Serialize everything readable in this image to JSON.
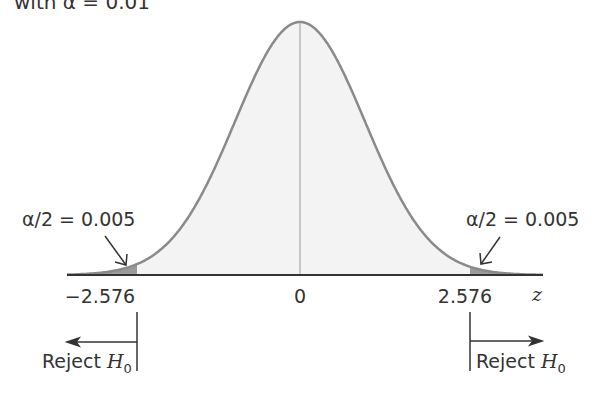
{
  "title": "with α = 0.01",
  "chart_data": {
    "type": "area",
    "xlabel": "z",
    "distribution": "standard normal",
    "x_ticks": [
      "−2.576",
      "0",
      "2.576"
    ],
    "critical_values": [
      -2.576,
      2.576
    ],
    "alpha": 0.01,
    "tail_area_each": 0.005,
    "annotations": {
      "left_tail": "α/2 = 0.005",
      "right_tail": "α/2 = 0.005",
      "left_reject": "Reject H0",
      "right_reject": "Reject H0"
    },
    "colors": {
      "curve": "#8a8a8a",
      "body_fill": "#f3f3f3",
      "tail_fill": "#9a9a9a",
      "axis": "#333333"
    }
  },
  "labels": {
    "tick_left": "−2.576",
    "tick_zero": "0",
    "tick_right": "2.576",
    "axis_var": "z",
    "alpha_left": "α/2 = 0.005",
    "alpha_right": "α/2 = 0.005",
    "reject_text": "Reject ",
    "reject_h": "H",
    "reject_sub": "0"
  }
}
